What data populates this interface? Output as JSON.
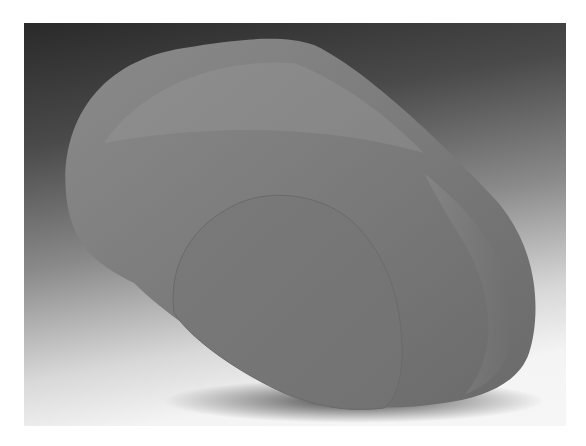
{
  "image": {
    "description": "Photograph of a smooth grey stone sculpture: a rounded elongated capsule form with a flat elliptical cut face on its front-right, set against a dark-to-white gradient backdrop",
    "colors": {
      "backdrop_top": "#2a2a2a",
      "backdrop_bottom": "#f6f6f6",
      "sculpture_body": "#7e7e7e",
      "sculpture_highlight": "#9a9a9a",
      "cut_face": "#787878",
      "shadow": "#3a3a3a"
    }
  }
}
